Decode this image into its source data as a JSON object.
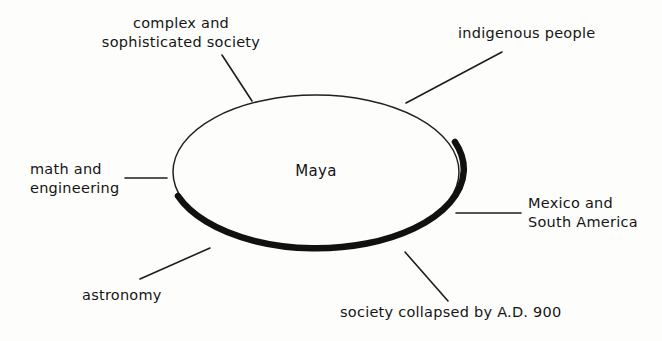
{
  "diagram": {
    "type": "concept-web",
    "title_node": "Maya",
    "background_color": "#fdfdfc",
    "ink_color": "#151515",
    "nodes": [
      {
        "id": "complex",
        "text": "complex and\nsophisticated society",
        "position": "top-left"
      },
      {
        "id": "indigenous",
        "text": "indigenous people",
        "position": "top-right"
      },
      {
        "id": "math",
        "text": "math and\nengineering",
        "position": "left"
      },
      {
        "id": "mexico",
        "text": "Mexico and\nSouth America",
        "position": "right"
      },
      {
        "id": "astronomy",
        "text": "astronomy",
        "position": "bottom-left"
      },
      {
        "id": "collapsed",
        "text": "society collapsed by A.D. 900",
        "position": "bottom-right"
      }
    ],
    "center": {
      "label": "Maya",
      "shape": "ellipse",
      "cx": 316,
      "cy": 172,
      "rx": 143,
      "ry": 77
    },
    "connectors": [
      {
        "from": "complex",
        "x1": 222,
        "y1": 55,
        "x2": 252,
        "y2": 101
      },
      {
        "from": "indigenous",
        "x1": 406,
        "y1": 103,
        "x2": 502,
        "y2": 52
      },
      {
        "from": "math",
        "x1": 125,
        "y1": 178,
        "x2": 167,
        "y2": 178
      },
      {
        "from": "mexico",
        "x1": 456,
        "y1": 213,
        "x2": 521,
        "y2": 213
      },
      {
        "from": "astronomy",
        "x1": 140,
        "y1": 279,
        "x2": 210,
        "y2": 248
      },
      {
        "from": "collapsed",
        "x1": 405,
        "y1": 252,
        "x2": 448,
        "y2": 301
      }
    ]
  }
}
